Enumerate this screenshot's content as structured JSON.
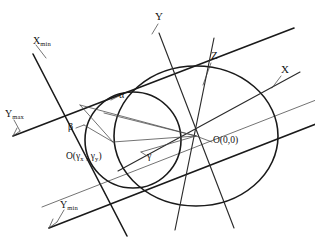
{
  "figure": {
    "kind": "geometric-diagram",
    "background_color": "#ffffff",
    "line_color": "#1a1a1a",
    "width": 315,
    "height": 245
  },
  "labels": {
    "axis_x": "X",
    "axis_y": "Y",
    "axis_z": "Z",
    "x_min_base": "X",
    "x_min_sub": "min",
    "y_max_base": "Y",
    "y_max_sub": "max",
    "y_min_base": "Y",
    "y_min_sub": "min",
    "alpha": "α",
    "beta": "β",
    "gamma": "γ",
    "origin_global": "O(0,0)",
    "origin_local_open": "O(",
    "origin_local_gamma1": "γ",
    "origin_local_sub1": "x",
    "origin_local_comma": " , ",
    "origin_local_gamma2": "γ",
    "origin_local_sub2": "y",
    "origin_local_close": ")"
  },
  "shapes": {
    "large_ellipse": {
      "cx": 196,
      "cy": 136,
      "rx": 82,
      "ry": 70
    },
    "small_circle": {
      "cx": 133,
      "cy": 140,
      "r": 48
    }
  }
}
